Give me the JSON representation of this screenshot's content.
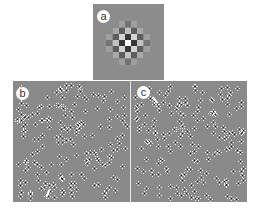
{
  "figure": {
    "panels": [
      {
        "id": "a",
        "label": "a",
        "type": "autocorrelation-checkerboard"
      },
      {
        "id": "b",
        "label": "b",
        "type": "dot-field"
      },
      {
        "id": "c",
        "label": "c",
        "type": "dot-field"
      }
    ]
  },
  "panel_a": {
    "center": [
      35,
      39
    ],
    "pitch": 6.2,
    "radius": 3,
    "background": "#8c8c8c"
  },
  "panel_b": {
    "seed": 17,
    "count": 190,
    "arrow": {
      "x": 34,
      "y": 108,
      "angle": 25
    }
  },
  "panel_c": {
    "seed": 53,
    "count": 185,
    "arrow": {
      "x": 23,
      "y": 15,
      "angle": -40
    }
  }
}
